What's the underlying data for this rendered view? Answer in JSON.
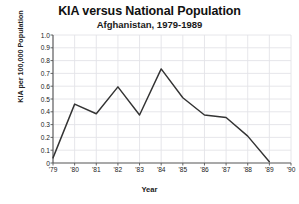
{
  "chart_data": {
    "type": "line",
    "title": "KIA versus National Population",
    "subtitle": "Afghanistan, 1979-1989",
    "xlabel": "Year",
    "ylabel": "KIA per 100,000 Population",
    "x": [
      "'79",
      "'80",
      "'81",
      "'82",
      "'83",
      "'84",
      "'85",
      "'86",
      "'87",
      "'88",
      "'89"
    ],
    "values": [
      0.04,
      0.46,
      0.385,
      0.595,
      0.375,
      0.735,
      0.51,
      0.375,
      0.355,
      0.21,
      0.01
    ],
    "x_tick_labels": [
      "'79",
      "'80",
      "'81",
      "'82",
      "'83",
      "'84",
      "'85",
      "'86",
      "'87",
      "'88",
      "'89",
      "'90"
    ],
    "y_tick_labels": [
      "1.0",
      "0.9",
      "0.8",
      "0.7",
      "0.6",
      "0.5",
      "0.4",
      "0.3",
      "0.2",
      "0.1",
      "0"
    ],
    "y_tick_values": [
      1.0,
      0.9,
      0.8,
      0.7,
      0.6,
      0.5,
      0.4,
      0.3,
      0.2,
      0.1,
      0.0
    ],
    "xlim": [
      0,
      11
    ],
    "ylim": [
      0,
      1.0
    ],
    "grid": true,
    "legend": "none",
    "series_color": "#333333",
    "grid_color": "#e3e3e8",
    "axis_color": "#555555",
    "background": "#ffffff"
  }
}
